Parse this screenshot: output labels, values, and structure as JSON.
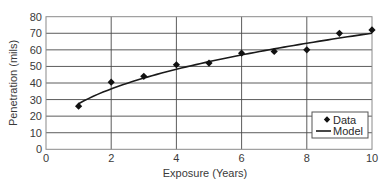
{
  "chart_data": {
    "type": "scatter",
    "title": "",
    "xlabel": "Exposure (Years)",
    "ylabel": "Penetration (mils)",
    "xlim": [
      0,
      10
    ],
    "ylim": [
      0,
      80
    ],
    "x_ticks": [
      0,
      2,
      4,
      6,
      8,
      10
    ],
    "y_ticks": [
      0,
      10,
      20,
      30,
      40,
      50,
      60,
      70,
      80
    ],
    "grid": true,
    "legend": {
      "placement": "bottom-right",
      "entries": [
        "Data",
        "Model"
      ]
    },
    "series": [
      {
        "name": "Data",
        "kind": "markers",
        "marker": "diamond",
        "x": [
          1,
          2,
          3,
          4,
          5,
          6,
          7,
          8,
          9,
          10
        ],
        "y": [
          26,
          40.5,
          44,
          51,
          52,
          58,
          59,
          60,
          70,
          72
        ]
      },
      {
        "name": "Model",
        "kind": "line",
        "form": "power law y = a * x^b",
        "a": 27.5,
        "b": 0.406,
        "x_range": [
          1,
          10
        ]
      }
    ]
  }
}
